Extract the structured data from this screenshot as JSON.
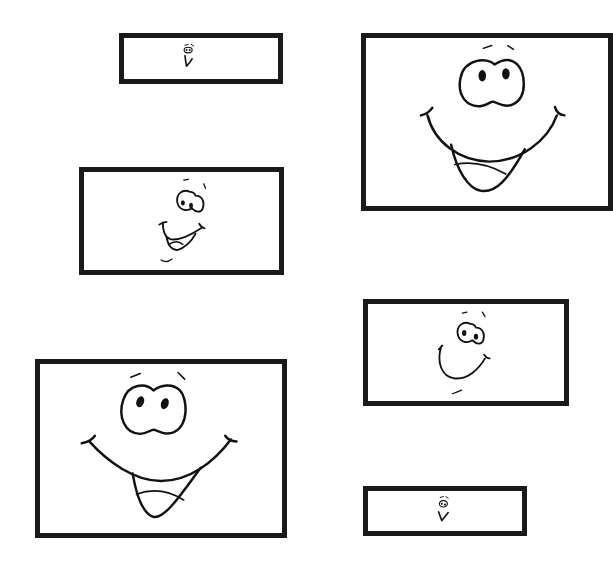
{
  "page": {
    "background": "#ffffff",
    "frame_color": "#1a1a1a"
  },
  "frames": [
    {
      "id": "small-top",
      "face": "tiny-surprised-face",
      "x": 119,
      "y": 33,
      "w": 164,
      "h": 51
    },
    {
      "id": "large-top-right",
      "face": "big-grin-face",
      "x": 361,
      "y": 33,
      "w": 252,
      "h": 178
    },
    {
      "id": "medium-left",
      "face": "tilted-grin-face",
      "x": 79,
      "y": 167,
      "w": 205,
      "h": 108
    },
    {
      "id": "medium-right",
      "face": "tilted-smile-face",
      "x": 363,
      "y": 299,
      "w": 206,
      "h": 107
    },
    {
      "id": "large-bottom-left",
      "face": "big-grin-face",
      "x": 35,
      "y": 359,
      "w": 252,
      "h": 179
    },
    {
      "id": "small-bottom",
      "face": "tiny-surprised-face",
      "x": 363,
      "y": 486,
      "w": 164,
      "h": 50
    }
  ]
}
